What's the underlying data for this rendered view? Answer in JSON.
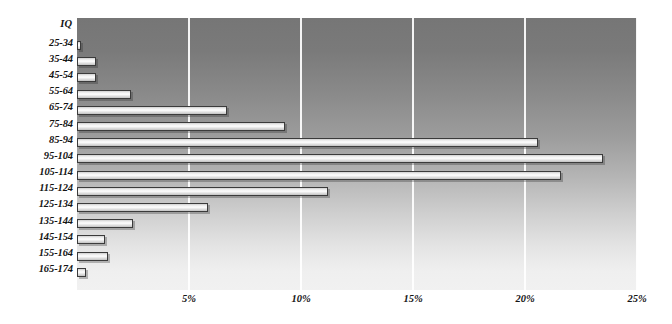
{
  "chart_data": {
    "type": "bar",
    "orientation": "horizontal",
    "title": "",
    "xlabel": "",
    "ylabel": "IQ",
    "axis_title": "IQ",
    "categories": [
      "25-34",
      "35-44",
      "45-54",
      "55-64",
      "65-74",
      "75-84",
      "85-94",
      "95-104",
      "105-114",
      "115-124",
      "125-134",
      "135-144",
      "145-154",
      "155-164",
      "165-174"
    ],
    "values": [
      0.15,
      0.85,
      0.85,
      2.4,
      6.7,
      9.3,
      20.6,
      23.5,
      21.6,
      11.2,
      5.85,
      2.5,
      1.25,
      1.4,
      0.4
    ],
    "value_unit": "%",
    "xlim": [
      0,
      25
    ],
    "ylim": null,
    "xticks": [
      5,
      10,
      15,
      20,
      25
    ],
    "xtick_labels": [
      "5%",
      "10%",
      "15%",
      "20%",
      "25%"
    ],
    "grid": "vertical-only",
    "legend": null,
    "legend_position": "none",
    "series": [
      {
        "name": "IQ distribution",
        "values": [
          0.15,
          0.85,
          0.85,
          2.4,
          6.7,
          9.3,
          20.6,
          23.5,
          21.6,
          11.2,
          5.85,
          2.5,
          1.25,
          1.4,
          0.4
        ]
      }
    ]
  },
  "colors": {
    "plot_background_top": "#767676",
    "plot_background_bottom": "#f1f1f1",
    "gridline": "#ffffff",
    "bar_fill_light": "#fbfbfb",
    "bar_fill_dark": "#c2c2c2",
    "bar_border": "#3b3b3b",
    "text": "#141414",
    "page_background": "#ffffff"
  }
}
